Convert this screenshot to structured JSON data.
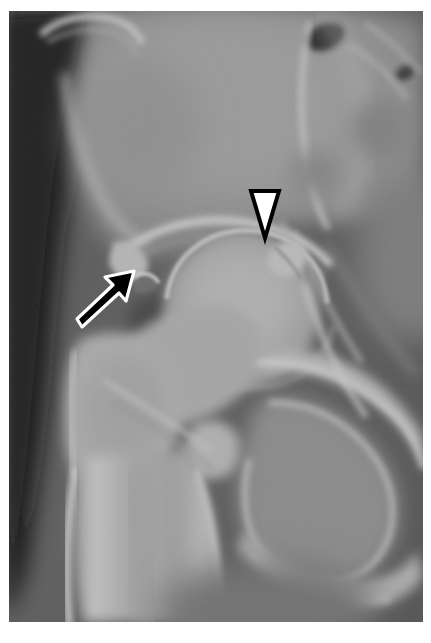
{
  "figure": {
    "kind": "radiograph",
    "modality": "X-ray",
    "view": "anteroposterior-hip",
    "title": "",
    "caption": "",
    "width_px": 431,
    "height_px": 643
  },
  "frame": {
    "border_color": "#ffffff",
    "border_top_px": 11,
    "border_left_px": 9,
    "border_right_px": 8,
    "border_bottom_px": 21,
    "image_left_px": 9,
    "image_top_px": 11,
    "image_width_px": 414,
    "image_height_px": 611
  },
  "palette": {
    "background_soft_tissue": "#4f4f4f",
    "dark_air": "#060606",
    "bone_mid": "#9a9a9a",
    "bone_bright": "#c9c9c9",
    "bone_cortex": "#dcdcdc",
    "joint_lucency": "#3b3b3b",
    "marker_white": "#ffffff",
    "marker_black": "#000000"
  },
  "annotations": [
    {
      "id": "arrowhead-marker",
      "name": "arrowhead-marker",
      "glyph": "filled-triangle-down",
      "fill": "#ffffff",
      "stroke": "#000000",
      "stroke_width": 3,
      "points_to": "femoral-head-neck-junction-superolateral",
      "x_px": 264,
      "y_px": 212,
      "width_px": 28,
      "height_px": 50
    },
    {
      "id": "arrow-marker",
      "name": "arrow-marker",
      "glyph": "arrow-up-right",
      "fill": "#000000",
      "stroke": "#ffffff",
      "stroke_width": 3,
      "points_to": "acetabular-margin-lesion",
      "tip_x_px": 134,
      "tip_y_px": 271,
      "tail_x_px": 76,
      "tail_y_px": 323,
      "length_px": 78
    }
  ],
  "anatomy": [
    {
      "id": "iliac-wing",
      "label": "Iliac wing",
      "region": "upper-left-center"
    },
    {
      "id": "iliac-crest-edge",
      "label": "Iliac crest cortical edge",
      "region": "upper-left"
    },
    {
      "id": "anterior-inferior-iliac-spine",
      "label": "Anterior inferior iliac spine",
      "region": "left-mid"
    },
    {
      "id": "sacrum",
      "label": "Sacrum",
      "region": "upper-right"
    },
    {
      "id": "sacroiliac-joint",
      "label": "Sacroiliac joint",
      "region": "upper-right"
    },
    {
      "id": "acetabular-roof",
      "label": "Acetabular roof (sourcil)",
      "region": "center"
    },
    {
      "id": "femoral-head",
      "label": "Femoral head",
      "region": "center"
    },
    {
      "id": "femoral-neck",
      "label": "Femoral neck",
      "region": "center-left"
    },
    {
      "id": "greater-trochanter",
      "label": "Greater trochanter",
      "region": "left-lower"
    },
    {
      "id": "lesser-trochanter",
      "label": "Lesser trochanter",
      "region": "center-lower"
    },
    {
      "id": "femoral-shaft",
      "label": "Proximal femoral shaft",
      "region": "lower-left"
    },
    {
      "id": "superior-pubic-ramus",
      "label": "Superior pubic ramus",
      "region": "lower-center-right"
    },
    {
      "id": "inferior-pubic-ramus",
      "label": "Inferior pubic ramus",
      "region": "lower-right"
    },
    {
      "id": "ischial-tuberosity",
      "label": "Ischial tuberosity",
      "region": "lower-right"
    },
    {
      "id": "obturator-foramen",
      "label": "Obturator foramen",
      "region": "lower-right"
    },
    {
      "id": "soft-tissue-shadow",
      "label": "Lateral soft tissue shadow",
      "region": "far-left"
    },
    {
      "id": "bowel-gas-lucency",
      "label": "Bowel gas lucency",
      "region": "top-right"
    }
  ]
}
